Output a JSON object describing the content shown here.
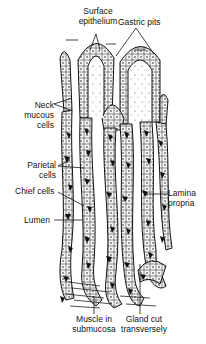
{
  "figure": {
    "colors": {
      "ink": "#141414",
      "background": "#ffffff",
      "cell_fill": "#f4f4f4",
      "parietal": "#111111"
    }
  },
  "labels": {
    "surface_epithelium": {
      "line1": "Surface",
      "line2": "epithelium"
    },
    "gastric_pits": {
      "line1": "Gastric pits"
    },
    "neck_mucous_cells": {
      "line1": "Neck",
      "line2": "mucous",
      "line3": "cells"
    },
    "parietal_cells": {
      "line1": "Parietal",
      "line2": "cells"
    },
    "chief_cells": {
      "line1": "Chief cells"
    },
    "lumen": {
      "line1": "Lumen"
    },
    "lamina_propria": {
      "line1": "Lamina",
      "line2": "propria"
    },
    "muscle_in_submucosa": {
      "line1": "Muscle in",
      "line2": "submucosa"
    },
    "gland_cut_transversely": {
      "line1": "Gland cut",
      "line2": "transversely"
    }
  }
}
